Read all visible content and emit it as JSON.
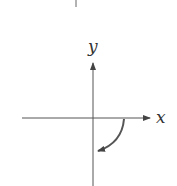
{
  "diagram": {
    "x_axis_label": "x",
    "y_axis_label": "y",
    "rotation_direction": "clockwise",
    "line_color": "#555555",
    "arrow_color": "#555555"
  }
}
